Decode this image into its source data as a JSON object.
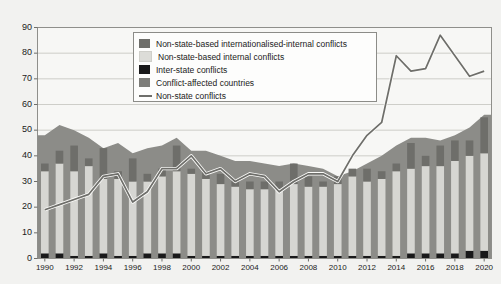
{
  "chart_data": {
    "type": "bar",
    "title": "",
    "subtitle": "",
    "xlabel": "",
    "ylabel": "",
    "ylim": [
      0,
      90
    ],
    "ytick_step": 10,
    "grid": true,
    "legend_position": "top-center",
    "yticks": [
      "90",
      "80",
      "70",
      "60",
      "50",
      "40",
      "30",
      "20",
      "10",
      "0"
    ],
    "xticks": [
      "1990",
      "1992",
      "1994",
      "1996",
      "1998",
      "2000",
      "2002",
      "2004",
      "2006",
      "2008",
      "2010",
      "2012",
      "2014",
      "2016",
      "2018",
      "2020"
    ],
    "categories": [
      1990,
      1991,
      1992,
      1993,
      1994,
      1995,
      1996,
      1997,
      1998,
      1999,
      2000,
      2001,
      2002,
      2003,
      2004,
      2005,
      2006,
      2007,
      2008,
      2009,
      2010,
      2011,
      2012,
      2013,
      2014,
      2015,
      2016,
      2017,
      2018,
      2019,
      2020
    ],
    "series": [
      {
        "name": "Inter-state conflicts",
        "stack": "bars",
        "color": "#19191a",
        "kind": "bar",
        "values": [
          2,
          2,
          1,
          1,
          2,
          1,
          1,
          2,
          2,
          2,
          1,
          1,
          1,
          1,
          1,
          1,
          1,
          1,
          1,
          1,
          1,
          1,
          1,
          1,
          1,
          2,
          2,
          2,
          2,
          3,
          3
        ]
      },
      {
        "name": "Non-state-based internal conflicts",
        "stack": "bars",
        "color": "#d6d6d2",
        "kind": "bar",
        "values": [
          32,
          35,
          33,
          35,
          29,
          30,
          29,
          28,
          30,
          32,
          32,
          30,
          28,
          27,
          26,
          26,
          26,
          28,
          27,
          27,
          28,
          31,
          29,
          30,
          33,
          33,
          34,
          34,
          36,
          37,
          38
        ]
      },
      {
        "name": "Non-state-based internationalised-internal conflicts",
        "stack": "bars",
        "color": "#6e6e6a",
        "kind": "bar",
        "values": [
          3,
          5,
          10,
          3,
          12,
          3,
          9,
          3,
          3,
          10,
          2,
          3,
          4,
          3,
          3,
          3,
          3,
          8,
          4,
          2,
          3,
          3,
          5,
          3,
          3,
          10,
          4,
          8,
          8,
          6,
          14
        ]
      },
      {
        "name": "Conflict-affected countries",
        "kind": "area",
        "color": "#8c8c88",
        "values": [
          48,
          52,
          50,
          47,
          43,
          45,
          41,
          43,
          44,
          47,
          42,
          42,
          40,
          38,
          38,
          37,
          36,
          37,
          36,
          35,
          32,
          34,
          37,
          40,
          44,
          47,
          47,
          46,
          48,
          51,
          56
        ]
      },
      {
        "name": "Non-state conflicts",
        "kind": "line",
        "color": "#6e6e6a",
        "values": [
          19,
          21,
          23,
          25,
          32,
          33,
          22,
          26,
          35,
          35,
          40,
          33,
          35,
          30,
          33,
          32,
          26,
          30,
          33,
          33,
          30,
          40,
          48,
          53,
          79,
          73,
          74,
          87,
          79,
          71,
          73
        ]
      }
    ],
    "legend_entries": [
      {
        "label": "Non-state-based internationalised-internal conflicts",
        "swatch": "#6e6e6a",
        "type": "box"
      },
      {
        "label": "Non-state-based internal conflicts",
        "swatch": "#d6d6d2",
        "type": "box"
      },
      {
        "label": "Inter-state conflicts",
        "swatch": "#19191a",
        "type": "box"
      },
      {
        "label": "Conflict-affected countries",
        "swatch": "#7d7d79",
        "type": "box"
      },
      {
        "label": "Non-state conflicts",
        "swatch": "#6e6e6a",
        "type": "line"
      }
    ]
  }
}
